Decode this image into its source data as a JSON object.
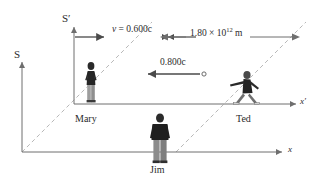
{
  "figure": {
    "frames": {
      "s_label": "S",
      "s_prime_label": "S′"
    },
    "axes": {
      "x_label": "x",
      "x_prime_label": "x′"
    },
    "people": {
      "mary": "Mary",
      "ted": "Ted",
      "jim": "Jim"
    },
    "annotations": {
      "frame_velocity_prefix": "v",
      "frame_velocity_equals": " = ",
      "frame_velocity_value": "0.600c",
      "frame_velocity_full": "v = 0.600c",
      "ball_speed": "0.800c",
      "distance_mantissa": "1.80 × 10",
      "distance_exponent": "12",
      "distance_unit": " m",
      "distance_full": "1.80 × 10¹² m"
    },
    "colors": {
      "background": "#ffffff",
      "axis": "#6e6e6e",
      "dashed_guide": "#b3b3b3",
      "arrow": "#4a4a4a",
      "text": "#2b2b2b",
      "figure_dark": "#262626",
      "figure_light": "#9a9a9a"
    }
  }
}
